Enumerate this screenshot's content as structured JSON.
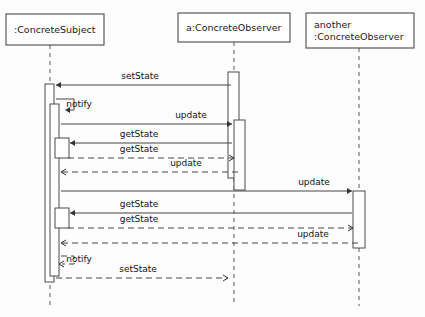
{
  "diagram": {
    "type": "uml-sequence-diagram",
    "canvas": {
      "width": 425,
      "height": 317
    },
    "colors": {
      "background": "#fdfdfd",
      "box_stroke": "#4a4a4a",
      "lifeline_stroke": "#6a6a6a",
      "message_stroke": "#444444",
      "text": "#111111"
    },
    "participants": [
      {
        "id": "subject",
        "name": ":ConcreteSubject",
        "lines": [
          ":ConcreteSubject"
        ],
        "box": {
          "x": 6,
          "y": 14,
          "w": 98,
          "h": 31
        },
        "lifeline_x": 50,
        "lifeline_top": 45,
        "lifeline_bottom": 306
      },
      {
        "id": "observer_a",
        "name": "a:ConcreteObserver",
        "lines": [
          "a:ConcreteObserver"
        ],
        "box": {
          "x": 178,
          "y": 13,
          "w": 112,
          "h": 29
        },
        "lifeline_x": 234,
        "lifeline_top": 42,
        "lifeline_bottom": 306
      },
      {
        "id": "observer_another",
        "name": "another :ConcreteObserver",
        "lines": [
          "another",
          ":ConcreteObserver"
        ],
        "box": {
          "x": 306,
          "y": 13,
          "w": 108,
          "h": 35
        },
        "lifeline_x": 359,
        "lifeline_top": 48,
        "lifeline_bottom": 306
      }
    ],
    "activations": [
      {
        "id": "subject-outer",
        "participant": "subject",
        "x": 45,
        "y": 84,
        "w": 9,
        "h": 198
      },
      {
        "id": "subject-notify",
        "participant": "subject",
        "x": 50,
        "y": 104,
        "w": 9,
        "h": 172
      },
      {
        "id": "subject-get-1",
        "participant": "subject",
        "x": 55,
        "y": 138,
        "w": 14,
        "h": 20
      },
      {
        "id": "subject-get-2",
        "participant": "subject",
        "x": 55,
        "y": 208,
        "w": 14,
        "h": 20
      },
      {
        "id": "obs-a-outer",
        "participant": "observer_a",
        "x": 228,
        "y": 72,
        "w": 11,
        "h": 106
      },
      {
        "id": "obs-a-inner",
        "participant": "observer_a",
        "x": 234,
        "y": 120,
        "w": 11,
        "h": 70
      },
      {
        "id": "obs-b-outer",
        "participant": "observer_another",
        "x": 353,
        "y": 191,
        "w": 12,
        "h": 57
      }
    ],
    "messages": [
      {
        "id": "m1",
        "label": "setState",
        "style": "solid",
        "direction": "left",
        "x1": 231,
        "x2": 56,
        "y": 85,
        "label_x": 140,
        "label_y": 79
      },
      {
        "id": "m2",
        "label": "notify",
        "style": "solid",
        "direction": "self",
        "x1": 56,
        "x2": 62,
        "y": 99,
        "y2": 110,
        "loop_x": 74,
        "label_x": 79,
        "label_y": 107
      },
      {
        "id": "m3",
        "label": "update",
        "style": "solid",
        "direction": "right",
        "x1": 61,
        "x2": 232,
        "y": 124,
        "label_x": 191,
        "label_y": 118
      },
      {
        "id": "m4",
        "label": "getState",
        "style": "solid",
        "direction": "left",
        "x1": 232,
        "x2": 70,
        "y": 143,
        "label_x": 139,
        "label_y": 137
      },
      {
        "id": "m5",
        "label": "getState",
        "style": "dashed",
        "direction": "right",
        "x1": 68,
        "x2": 234,
        "y": 158,
        "label_x": 139,
        "label_y": 152
      },
      {
        "id": "m6",
        "label": "update",
        "style": "dashed",
        "direction": "left",
        "x1": 238,
        "x2": 61,
        "y": 172,
        "label_x": 186,
        "label_y": 166
      },
      {
        "id": "m7",
        "label": "update",
        "style": "solid",
        "direction": "right",
        "x1": 61,
        "x2": 352,
        "y": 191,
        "label_x": 314,
        "label_y": 185
      },
      {
        "id": "m8",
        "label": "getState",
        "style": "solid",
        "direction": "left",
        "x1": 352,
        "x2": 70,
        "y": 213,
        "label_x": 139,
        "label_y": 207
      },
      {
        "id": "m9",
        "label": "getState",
        "style": "dashed",
        "direction": "right",
        "x1": 68,
        "x2": 353,
        "y": 228,
        "label_x": 139,
        "label_y": 222
      },
      {
        "id": "m10",
        "label": "update",
        "style": "dashed",
        "direction": "left",
        "x1": 358,
        "x2": 61,
        "y": 243,
        "label_x": 313,
        "label_y": 237
      },
      {
        "id": "m11",
        "label": "notify",
        "style": "dashed",
        "direction": "self",
        "x1": 61,
        "x2": 56,
        "y": 256,
        "y2": 264,
        "loop_x": 74,
        "label_x": 79,
        "label_y": 262
      },
      {
        "id": "m12",
        "label": "setState",
        "style": "dashed",
        "direction": "right",
        "x1": 56,
        "x2": 228,
        "y": 278,
        "label_x": 138,
        "label_y": 272
      }
    ]
  }
}
